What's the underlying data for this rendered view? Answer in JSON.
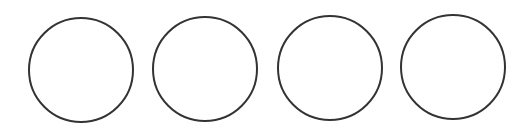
{
  "diagram": {
    "background": "#ffffff",
    "stroke_color": "#333333",
    "stroke_width": 2,
    "fill": "none",
    "shapes": [
      {
        "type": "circle",
        "cx": 81,
        "cy": 70,
        "r": 52
      },
      {
        "type": "circle",
        "cx": 205,
        "cy": 69,
        "r": 52
      },
      {
        "type": "circle",
        "cx": 330,
        "cy": 68,
        "r": 52
      },
      {
        "type": "circle",
        "cx": 453,
        "cy": 67,
        "r": 52
      }
    ]
  }
}
